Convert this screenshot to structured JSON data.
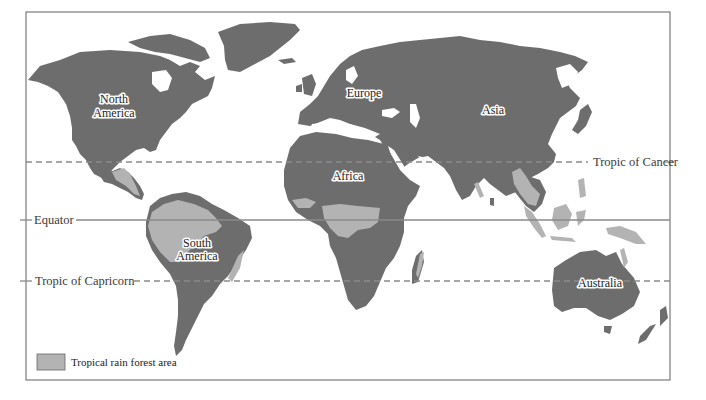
{
  "map": {
    "title": "World tropical rain forest distribution",
    "colors": {
      "land": "#6d6d6d",
      "rain_forest": "#b3b3b3",
      "background": "#ffffff",
      "lines": "#8a8a8a"
    },
    "latitude_lines": {
      "tropic_of_cancer": "Tropic of Cancer",
      "equator": "Equator",
      "tropic_of_capricorn": "Tropic of Capricorn"
    },
    "continents": {
      "north_america_line1": "North",
      "north_america_line2": "America",
      "south_america_line1": "South",
      "south_america_line2": "America",
      "europe": "Europe",
      "asia": "Asia",
      "africa": "Africa",
      "australia": "Australia"
    },
    "legend": {
      "label": "Tropical rain forest area",
      "swatch_color": "#b3b3b3"
    }
  }
}
